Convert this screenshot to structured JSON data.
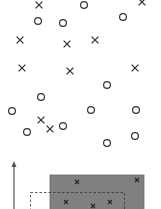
{
  "diagram": {
    "markers": [
      {
        "type": "x",
        "x": 39,
        "y": 5
      },
      {
        "type": "o",
        "x": 84,
        "y": 5
      },
      {
        "type": "x",
        "x": 142,
        "y": 2
      },
      {
        "type": "o",
        "x": 38,
        "y": 21
      },
      {
        "type": "o",
        "x": 63,
        "y": 23
      },
      {
        "type": "o",
        "x": 123,
        "y": 17
      },
      {
        "type": "x",
        "x": 20,
        "y": 40
      },
      {
        "type": "x",
        "x": 67,
        "y": 44
      },
      {
        "type": "x",
        "x": 95,
        "y": 40
      },
      {
        "type": "x",
        "x": 22,
        "y": 68
      },
      {
        "type": "x",
        "x": 70,
        "y": 71
      },
      {
        "type": "x",
        "x": 135,
        "y": 68
      },
      {
        "type": "o",
        "x": 107,
        "y": 85
      },
      {
        "type": "o",
        "x": 41,
        "y": 97
      },
      {
        "type": "o",
        "x": 12,
        "y": 111
      },
      {
        "type": "o",
        "x": 91,
        "y": 110
      },
      {
        "type": "o",
        "x": 136,
        "y": 110
      },
      {
        "type": "x",
        "x": 41,
        "y": 120
      },
      {
        "type": "x",
        "x": 50,
        "y": 129
      },
      {
        "type": "o",
        "x": 63,
        "y": 126
      },
      {
        "type": "o",
        "x": 27,
        "y": 132
      },
      {
        "type": "o",
        "x": 107,
        "y": 143
      },
      {
        "type": "o",
        "x": 135,
        "y": 136
      }
    ],
    "inset_markers": [
      {
        "x": 77,
        "y": 182
      },
      {
        "x": 137,
        "y": 180
      },
      {
        "x": 66,
        "y": 202
      },
      {
        "x": 93,
        "y": 206
      },
      {
        "x": 110,
        "y": 202
      }
    ],
    "colors": {
      "marker": "#333333",
      "shaded": "#808080",
      "dashed": "#333333",
      "axis": "#555555"
    }
  }
}
